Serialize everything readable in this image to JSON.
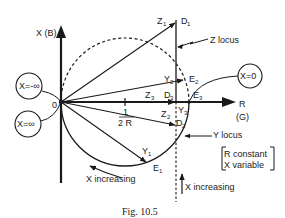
{
  "figure": {
    "caption": "Fig. 10.5",
    "axes": {
      "vertical_label": "X (B)",
      "horizontal_label": "R",
      "horizontal_sublabel": "(G)",
      "origin_label": "0"
    },
    "tick_label": {
      "num": "1",
      "den": "2 R"
    },
    "circle_labels": {
      "neg_inf": "X=-∞",
      "pos_inf": "X=∞",
      "zero": "X=0"
    },
    "points": {
      "Z1": {
        "base": "Z",
        "sub": "1"
      },
      "D1": {
        "base": "D",
        "sub": "1"
      },
      "Y2": {
        "base": "Y",
        "sub": "2"
      },
      "E2": {
        "base": "E",
        "sub": "2"
      },
      "Z3": {
        "base": "Z",
        "sub": "3"
      },
      "D3": {
        "base": "D",
        "sub": "3"
      },
      "E3": {
        "base": "E",
        "sub": "3"
      },
      "Y3": {
        "base": "Y",
        "sub": "3"
      },
      "Z2": {
        "base": "Z",
        "sub": "2"
      },
      "D2": {
        "base": "D",
        "sub": "2"
      },
      "Y1": {
        "base": "Y",
        "sub": "1"
      },
      "E1": {
        "base": "E",
        "sub": "1"
      }
    },
    "annotations": {
      "z_locus": "Z locus",
      "y_locus": "Y locus",
      "x_increasing_left": "X increasing",
      "x_increasing_right": "X increasing",
      "note_line1": "R constant",
      "note_line2": "X variable"
    }
  }
}
